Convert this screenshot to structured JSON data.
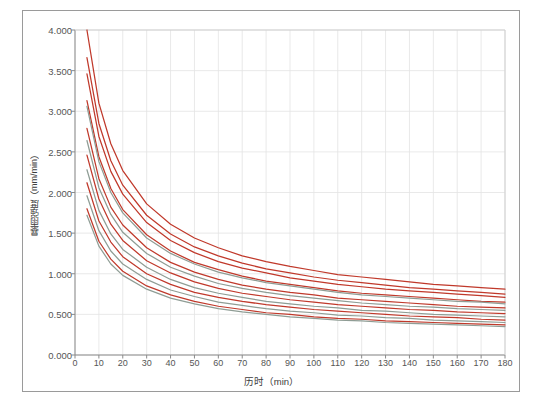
{
  "chart_data": {
    "type": "line",
    "title": "",
    "xlabel": "历时（min）",
    "ylabel": "暴雨强度（mm/min）",
    "xlim": [
      0,
      180
    ],
    "ylim": [
      0,
      4.0
    ],
    "xticks": [
      0,
      10,
      20,
      30,
      40,
      50,
      60,
      70,
      80,
      90,
      100,
      110,
      120,
      130,
      140,
      150,
      160,
      170,
      180
    ],
    "yticks": [
      "0.000",
      "0.500",
      "1.000",
      "1.500",
      "2.000",
      "2.500",
      "3.000",
      "3.500",
      "4.000"
    ],
    "ytick_values": [
      0.0,
      0.5,
      1.0,
      1.5,
      2.0,
      2.5,
      3.0,
      3.5,
      4.0
    ],
    "grid": true,
    "legend": "none",
    "x": [
      5,
      10,
      15,
      20,
      30,
      40,
      50,
      60,
      70,
      80,
      90,
      100,
      110,
      120,
      130,
      140,
      150,
      160,
      170,
      180
    ],
    "series": [
      {
        "name": "P=100a",
        "color": "#c0392b",
        "values": [
          4.0,
          3.1,
          2.6,
          2.27,
          1.86,
          1.61,
          1.44,
          1.32,
          1.22,
          1.15,
          1.09,
          1.04,
          0.99,
          0.96,
          0.93,
          0.9,
          0.87,
          0.85,
          0.83,
          0.81
        ]
      },
      {
        "name": "P=50a",
        "color": "#c0392b",
        "values": [
          3.66,
          2.85,
          2.39,
          2.09,
          1.72,
          1.49,
          1.33,
          1.22,
          1.13,
          1.06,
          1.01,
          0.96,
          0.92,
          0.89,
          0.86,
          0.83,
          0.81,
          0.79,
          0.77,
          0.75
        ]
      },
      {
        "name": "P=30a",
        "color": "#c0392b",
        "values": [
          3.46,
          2.69,
          2.26,
          1.98,
          1.63,
          1.41,
          1.26,
          1.15,
          1.07,
          1.01,
          0.95,
          0.91,
          0.87,
          0.84,
          0.81,
          0.79,
          0.77,
          0.75,
          0.73,
          0.71
        ]
      },
      {
        "name": "P=20a",
        "color": "#c0392b",
        "values": [
          3.13,
          2.44,
          2.05,
          1.79,
          1.48,
          1.28,
          1.14,
          1.05,
          0.97,
          0.91,
          0.87,
          0.83,
          0.79,
          0.76,
          0.74,
          0.72,
          0.7,
          0.68,
          0.66,
          0.65
        ]
      },
      {
        "name": "P=15a",
        "color": "#8f9d95",
        "values": [
          3.06,
          2.38,
          2.0,
          1.75,
          1.44,
          1.25,
          1.12,
          1.02,
          0.95,
          0.89,
          0.85,
          0.81,
          0.77,
          0.74,
          0.72,
          0.7,
          0.68,
          0.66,
          0.65,
          0.63
        ]
      },
      {
        "name": "P=10a",
        "color": "#c0392b",
        "values": [
          2.79,
          2.17,
          1.82,
          1.6,
          1.32,
          1.14,
          1.02,
          0.93,
          0.86,
          0.81,
          0.77,
          0.74,
          0.7,
          0.68,
          0.66,
          0.64,
          0.62,
          0.6,
          0.59,
          0.58
        ]
      },
      {
        "name": "P=8a",
        "color": "#8f9d95",
        "values": [
          2.64,
          2.06,
          1.73,
          1.51,
          1.25,
          1.08,
          0.97,
          0.88,
          0.82,
          0.77,
          0.73,
          0.7,
          0.67,
          0.64,
          0.62,
          0.6,
          0.59,
          0.57,
          0.56,
          0.55
        ]
      },
      {
        "name": "P=5a",
        "color": "#c0392b",
        "values": [
          2.46,
          1.92,
          1.61,
          1.41,
          1.16,
          1.01,
          0.9,
          0.82,
          0.76,
          0.72,
          0.68,
          0.65,
          0.62,
          0.6,
          0.58,
          0.56,
          0.55,
          0.53,
          0.52,
          0.51
        ]
      },
      {
        "name": "P=3a",
        "color": "#8f9d95",
        "values": [
          2.28,
          1.78,
          1.49,
          1.3,
          1.08,
          0.93,
          0.83,
          0.76,
          0.71,
          0.66,
          0.63,
          0.6,
          0.58,
          0.55,
          0.54,
          0.52,
          0.5,
          0.49,
          0.48,
          0.47
        ]
      },
      {
        "name": "P=2a",
        "color": "#c0392b",
        "values": [
          2.12,
          1.65,
          1.39,
          1.21,
          1.0,
          0.87,
          0.77,
          0.71,
          0.66,
          0.62,
          0.59,
          0.56,
          0.54,
          0.52,
          0.5,
          0.48,
          0.47,
          0.46,
          0.44,
          0.43
        ]
      },
      {
        "name": "P=1.5a",
        "color": "#8f9d95",
        "values": [
          1.96,
          1.53,
          1.28,
          1.12,
          0.93,
          0.8,
          0.72,
          0.65,
          0.61,
          0.57,
          0.54,
          0.52,
          0.49,
          0.48,
          0.46,
          0.45,
          0.43,
          0.42,
          0.41,
          0.4
        ]
      },
      {
        "name": "P=1a",
        "color": "#c0392b",
        "values": [
          1.8,
          1.4,
          1.18,
          1.03,
          0.85,
          0.74,
          0.66,
          0.6,
          0.56,
          0.52,
          0.5,
          0.47,
          0.45,
          0.44,
          0.42,
          0.41,
          0.4,
          0.39,
          0.38,
          0.37
        ]
      },
      {
        "name": "P=0.5a",
        "color": "#8f9d95",
        "values": [
          1.72,
          1.34,
          1.12,
          0.98,
          0.81,
          0.7,
          0.63,
          0.57,
          0.53,
          0.5,
          0.47,
          0.45,
          0.43,
          0.42,
          0.4,
          0.39,
          0.38,
          0.37,
          0.36,
          0.35
        ]
      }
    ]
  }
}
